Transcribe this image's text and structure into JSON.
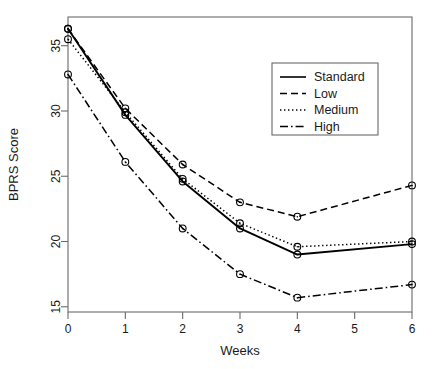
{
  "chart_data": {
    "type": "line",
    "title": "",
    "xlabel": "Weeks",
    "ylabel": "BPRS Score",
    "x": [
      0,
      1,
      2,
      3,
      4,
      6
    ],
    "xlim": [
      0,
      6
    ],
    "ylim": [
      14.6,
      37.2
    ],
    "xticks": [
      0,
      1,
      2,
      3,
      4,
      5,
      6
    ],
    "xtick_labels": [
      "0",
      "1",
      "2",
      "3",
      "4",
      "5",
      "6"
    ],
    "yticks": [
      15,
      20,
      25,
      30,
      35
    ],
    "ytick_labels": [
      "15",
      "20",
      "25",
      "30",
      "35"
    ],
    "grid": false,
    "legend_position": "top-right",
    "marker": "circle-dot",
    "series": [
      {
        "name": "Standard",
        "linestyle": "solid",
        "color": "#000000",
        "values": [
          36.3,
          29.7,
          24.6,
          21.0,
          19.0,
          19.8
        ]
      },
      {
        "name": "Low",
        "linestyle": "dashed",
        "color": "#000000",
        "values": [
          36.3,
          30.2,
          25.9,
          23.0,
          21.9,
          24.3
        ]
      },
      {
        "name": "Medium",
        "linestyle": "dotted",
        "color": "#000000",
        "values": [
          35.5,
          29.9,
          24.8,
          21.4,
          19.6,
          20.0
        ]
      },
      {
        "name": "High",
        "linestyle": "dashdot",
        "color": "#000000",
        "values": [
          32.8,
          26.1,
          21.0,
          17.5,
          15.7,
          16.7
        ]
      }
    ]
  },
  "legend": {
    "entries": [
      {
        "label": "Standard"
      },
      {
        "label": "Low"
      },
      {
        "label": "Medium"
      },
      {
        "label": "High"
      }
    ]
  }
}
